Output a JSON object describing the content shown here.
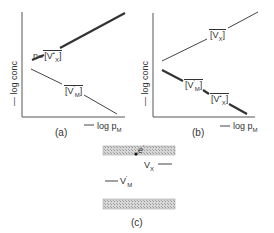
{
  "panel_a": {
    "caption": "(a)",
    "y_axis_label": "log conc",
    "x_axis_label": "log p",
    "x_axis_sub": "M",
    "curves": [
      {
        "label_prefix": "n=",
        "species": "V",
        "sub": "X",
        "sup": "•"
      },
      {
        "species": "V",
        "sub": "M",
        "sup": "'"
      }
    ]
  },
  "panel_b": {
    "caption": "(b)",
    "y_axis_label": "log conc",
    "x_axis_label": "log p",
    "x_axis_sub": "M",
    "curves": [
      {
        "species": "V",
        "sub": "X"
      },
      {
        "species": "V",
        "sub": "M",
        "sup": "'"
      },
      {
        "species": "V",
        "sub": "X",
        "sup": "•"
      }
    ]
  },
  "panel_c": {
    "caption": "(c)",
    "levels": [
      {
        "label": "e",
        "sup": "'"
      },
      {
        "label": "V",
        "sub": "X"
      },
      {
        "label": "V",
        "sub": "M",
        "sup": "'"
      }
    ]
  },
  "colors": {
    "line": "#333333",
    "band": "#bdbdbd"
  }
}
